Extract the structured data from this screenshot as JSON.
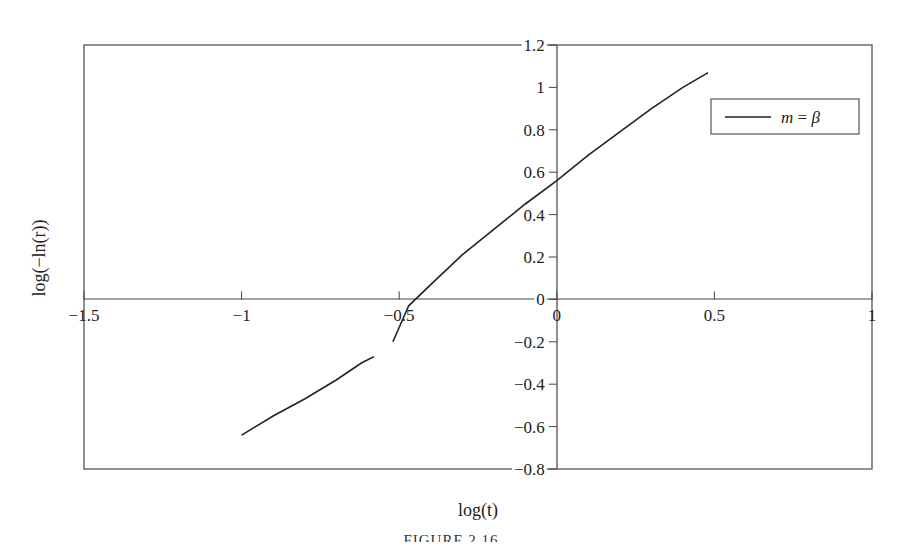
{
  "chart_data": {
    "type": "line",
    "title": "",
    "xlabel": "log(t)",
    "ylabel": "log(−ln(r))",
    "xlim": [
      -1.5,
      1
    ],
    "ylim": [
      -0.8,
      1.2
    ],
    "x_ticks": [
      "−1.5",
      "−1",
      "−0.5",
      "0",
      "0.5",
      "1"
    ],
    "x_tick_values": [
      -1.5,
      -1,
      -0.5,
      0,
      0.5,
      1
    ],
    "y_ticks": [
      "1.2",
      "1",
      "0.8",
      "0.6",
      "0.4",
      "0.2",
      "0",
      "−0.2",
      "−0.4",
      "−0.6",
      "−0.8"
    ],
    "y_tick_values": [
      1.2,
      1,
      0.8,
      0.6,
      0.4,
      0.2,
      0,
      -0.2,
      -0.4,
      -0.6,
      -0.8
    ],
    "grid": false,
    "legend": {
      "position": "upper right",
      "entries": [
        "m = β"
      ]
    },
    "series": [
      {
        "name": "m = β",
        "x": [
          -1.0,
          -0.9,
          -0.8,
          -0.7,
          -0.62,
          -0.58,
          -0.52,
          -0.47,
          -0.4,
          -0.3,
          -0.2,
          -0.1,
          0.0,
          0.1,
          0.2,
          0.3,
          0.4,
          0.48
        ],
        "y": [
          -0.64,
          -0.55,
          -0.47,
          -0.38,
          -0.3,
          -0.27,
          -0.2,
          -0.03,
          0.07,
          0.21,
          0.33,
          0.45,
          0.56,
          0.68,
          0.79,
          0.9,
          1.0,
          1.07
        ]
      }
    ]
  },
  "legend": {
    "label_var": "m",
    "label_eq": " = ",
    "label_sym": "β"
  },
  "caption": "FIGURE 2.16"
}
